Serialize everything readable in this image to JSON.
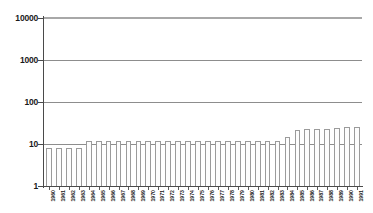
{
  "chart_data": {
    "type": "bar",
    "title": "",
    "subtitle": "",
    "xlabel": "",
    "ylabel": "",
    "yscale": "log",
    "ylim": [
      1,
      10000
    ],
    "grid": true,
    "legend": false,
    "legend_position": "none",
    "y_ticks": [
      "10000",
      "1000",
      "100",
      "10",
      "1"
    ],
    "y_tick_values": [
      10000,
      1000,
      100,
      10,
      1
    ],
    "categories": [
      "1960",
      "1961",
      "1962",
      "1963",
      "1964",
      "1965",
      "1966",
      "1967",
      "1968",
      "1969",
      "1970",
      "1971",
      "1972",
      "1973",
      "1974",
      "1975",
      "1976",
      "1977",
      "1978",
      "1979",
      "1980",
      "1981",
      "1982",
      "1983",
      "1984",
      "1985",
      "1986",
      "1987",
      "1988",
      "1989",
      "1990",
      "1991"
    ],
    "values": [
      8,
      8,
      8,
      8,
      12,
      12,
      12,
      12,
      12,
      12,
      12,
      12,
      12,
      12,
      12,
      12,
      12,
      12,
      12,
      12,
      12,
      12,
      12,
      12,
      15,
      22,
      23,
      23,
      23,
      24,
      25,
      25
    ],
    "series": [
      {
        "name": "Count",
        "values": [
          8,
          8,
          8,
          8,
          12,
          12,
          12,
          12,
          12,
          12,
          12,
          12,
          12,
          12,
          12,
          12,
          12,
          12,
          12,
          12,
          12,
          12,
          12,
          12,
          15,
          22,
          23,
          23,
          23,
          24,
          25,
          25
        ]
      }
    ]
  },
  "style": {
    "bar_fill": "#fdfdfd",
    "bar_outline": "#9b9b9b",
    "grid_color": "#8d8d8d",
    "axis_color": "#4a4a4a",
    "text_color": "#1a1a1a",
    "background": "#ffffff"
  }
}
